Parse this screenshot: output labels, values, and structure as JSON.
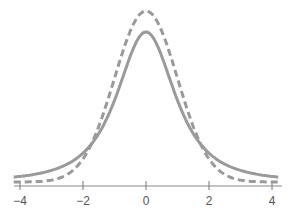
{
  "chart_data": {
    "type": "line",
    "title": "",
    "xlabel": "",
    "ylabel": "",
    "xlim": [
      -4.2,
      4.2
    ],
    "ticks": [
      -4,
      -2,
      0,
      2,
      4
    ],
    "tick_labels": [
      "−4",
      "−2",
      "0",
      "2",
      "4"
    ],
    "grid": false,
    "legend": null,
    "series": [
      {
        "name": "t-distribution (heavier tails)",
        "style": "solid",
        "color": "#9a9a9a",
        "kind": "t",
        "df": 2,
        "peak_px": 32
      },
      {
        "name": "normal distribution",
        "style": "dashed",
        "color": "#9a9a9a",
        "kind": "normal",
        "peak_px": 11
      }
    ]
  }
}
